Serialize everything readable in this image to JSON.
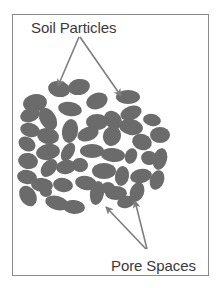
{
  "diagram": {
    "labels": {
      "soil_particles": "Soil Particles",
      "pore_spaces": "Pore Spaces"
    },
    "colors": {
      "particle": "#6b6b6b",
      "arrow": "#7d7d7d",
      "frame": "#8a8a8a",
      "text": "#3a3a3a",
      "background": "#ffffff"
    },
    "arrows": [
      {
        "name": "soil-arrow-left",
        "from": [
          79,
          37
        ],
        "to": [
          58,
          86
        ]
      },
      {
        "name": "soil-arrow-right",
        "from": [
          80,
          37
        ],
        "to": [
          121,
          96
        ]
      },
      {
        "name": "pore-arrow-left",
        "from": [
          146,
          249
        ],
        "to": [
          106,
          207
        ]
      },
      {
        "name": "pore-arrow-right",
        "from": [
          147,
          249
        ],
        "to": [
          135,
          201
        ]
      }
    ],
    "particles": [
      {
        "cx": 59,
        "cy": 89,
        "rx": 11,
        "ry": 8,
        "rot": 10
      },
      {
        "cx": 79,
        "cy": 87,
        "rx": 11,
        "ry": 8,
        "rot": -10
      },
      {
        "cx": 128,
        "cy": 97,
        "rx": 12,
        "ry": 7,
        "rot": 0
      },
      {
        "cx": 35,
        "cy": 103,
        "rx": 12,
        "ry": 9,
        "rot": -10
      },
      {
        "cx": 97,
        "cy": 101,
        "rx": 11,
        "ry": 8,
        "rot": -20
      },
      {
        "cx": 70,
        "cy": 109,
        "rx": 12,
        "ry": 7,
        "rot": 10
      },
      {
        "cx": 30,
        "cy": 115,
        "rx": 10,
        "ry": 7,
        "rot": -20
      },
      {
        "cx": 48,
        "cy": 119,
        "rx": 8,
        "ry": 12,
        "rot": -30
      },
      {
        "cx": 131,
        "cy": 113,
        "rx": 11,
        "ry": 7,
        "rot": -20
      },
      {
        "cx": 97,
        "cy": 122,
        "rx": 11,
        "ry": 8,
        "rot": 0
      },
      {
        "cx": 113,
        "cy": 120,
        "rx": 8,
        "ry": 10,
        "rot": -40
      },
      {
        "cx": 152,
        "cy": 120,
        "rx": 9,
        "ry": 6,
        "rot": 10
      },
      {
        "cx": 30,
        "cy": 130,
        "rx": 10,
        "ry": 7,
        "rot": 15
      },
      {
        "cx": 48,
        "cy": 136,
        "rx": 11,
        "ry": 8,
        "rot": 10
      },
      {
        "cx": 70,
        "cy": 131,
        "rx": 8,
        "ry": 12,
        "rot": 10
      },
      {
        "cx": 88,
        "cy": 134,
        "rx": 11,
        "ry": 7,
        "rot": -20
      },
      {
        "cx": 131,
        "cy": 127,
        "rx": 12,
        "ry": 8,
        "rot": 10
      },
      {
        "cx": 160,
        "cy": 135,
        "rx": 10,
        "ry": 8,
        "rot": 0
      },
      {
        "cx": 112,
        "cy": 136,
        "rx": 9,
        "ry": 10,
        "rot": 20
      },
      {
        "cx": 142,
        "cy": 142,
        "rx": 10,
        "ry": 8,
        "rot": 20
      },
      {
        "cx": 27,
        "cy": 144,
        "rx": 9,
        "ry": 7,
        "rot": 30
      },
      {
        "cx": 48,
        "cy": 152,
        "rx": 12,
        "ry": 8,
        "rot": -10
      },
      {
        "cx": 68,
        "cy": 152,
        "rx": 6,
        "ry": 10,
        "rot": 30
      },
      {
        "cx": 92,
        "cy": 151,
        "rx": 12,
        "ry": 7,
        "rot": 0
      },
      {
        "cx": 113,
        "cy": 155,
        "rx": 12,
        "ry": 7,
        "rot": 5
      },
      {
        "cx": 131,
        "cy": 156,
        "rx": 6,
        "ry": 8,
        "rot": 20
      },
      {
        "cx": 149,
        "cy": 158,
        "rx": 8,
        "ry": 7,
        "rot": 10
      },
      {
        "cx": 160,
        "cy": 159,
        "rx": 7,
        "ry": 11,
        "rot": 15
      },
      {
        "cx": 28,
        "cy": 161,
        "rx": 10,
        "ry": 8,
        "rot": 10
      },
      {
        "cx": 49,
        "cy": 168,
        "rx": 7,
        "ry": 10,
        "rot": 40
      },
      {
        "cx": 66,
        "cy": 167,
        "rx": 10,
        "ry": 7,
        "rot": -10
      },
      {
        "cx": 80,
        "cy": 165,
        "rx": 8,
        "ry": 7,
        "rot": 10
      },
      {
        "cx": 104,
        "cy": 171,
        "rx": 12,
        "ry": 8,
        "rot": 0
      },
      {
        "cx": 122,
        "cy": 176,
        "rx": 7,
        "ry": 10,
        "rot": 10
      },
      {
        "cx": 141,
        "cy": 176,
        "rx": 11,
        "ry": 7,
        "rot": -10
      },
      {
        "cx": 157,
        "cy": 180,
        "rx": 7,
        "ry": 10,
        "rot": 20
      },
      {
        "cx": 27,
        "cy": 177,
        "rx": 10,
        "ry": 7,
        "rot": 10
      },
      {
        "cx": 42,
        "cy": 185,
        "rx": 11,
        "ry": 7,
        "rot": 5
      },
      {
        "cx": 63,
        "cy": 185,
        "rx": 10,
        "ry": 7,
        "rot": 10
      },
      {
        "cx": 86,
        "cy": 183,
        "rx": 11,
        "ry": 7,
        "rot": 10
      },
      {
        "cx": 97,
        "cy": 193,
        "rx": 7,
        "ry": 12,
        "rot": 10
      },
      {
        "cx": 116,
        "cy": 193,
        "rx": 11,
        "ry": 7,
        "rot": 0
      },
      {
        "cx": 137,
        "cy": 192,
        "rx": 7,
        "ry": 10,
        "rot": 20
      },
      {
        "cx": 28,
        "cy": 196,
        "rx": 8,
        "ry": 11,
        "rot": -30
      },
      {
        "cx": 57,
        "cy": 203,
        "rx": 12,
        "ry": 7,
        "rot": 15
      },
      {
        "cx": 74,
        "cy": 207,
        "rx": 11,
        "ry": 7,
        "rot": 5
      },
      {
        "cx": 108,
        "cy": 188,
        "rx": 7,
        "ry": 6,
        "rot": 0
      },
      {
        "cx": 126,
        "cy": 202,
        "rx": 9,
        "ry": 6,
        "rot": -10
      },
      {
        "cx": 46,
        "cy": 192,
        "rx": 6,
        "ry": 5,
        "rot": 0
      }
    ]
  }
}
